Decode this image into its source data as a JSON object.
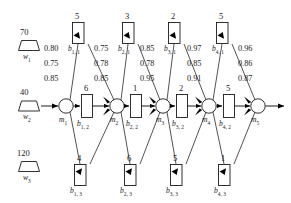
{
  "diagram": {
    "type": "block-flow-network",
    "colors": {
      "stroke": "#1a1a1a",
      "fill": "#ffffff",
      "text": "#1a1a1a",
      "arrow": "#000000"
    }
  },
  "inputs": [
    {
      "value": "70",
      "name": "w",
      "index": "1",
      "shape": "trapezoid"
    },
    {
      "value": "40",
      "name": "w",
      "index": "2",
      "shape": "trapezoid"
    },
    {
      "value": "120",
      "name": "w",
      "index": "3",
      "shape": "trapezoid"
    }
  ],
  "nodes": [
    {
      "name": "m",
      "index": "1"
    },
    {
      "name": "m",
      "index": "2"
    },
    {
      "name": "m",
      "index": "3"
    },
    {
      "name": "m",
      "index": "4"
    },
    {
      "name": "m",
      "index": "5"
    }
  ],
  "stages": [
    {
      "stage": 1,
      "top": {
        "value": "5",
        "name": "b",
        "index": "1, 1"
      },
      "middle": {
        "value": "6",
        "name": "b",
        "index": "1, 2"
      },
      "bottom": {
        "value": "4",
        "name": "b",
        "index": "1, 3"
      }
    },
    {
      "stage": 2,
      "top": {
        "value": "3",
        "name": "b",
        "index": "2, 1"
      },
      "middle": {
        "value": "1",
        "name": "b",
        "index": "2, 2"
      },
      "bottom": {
        "value": "6",
        "name": "b",
        "index": "2, 3"
      }
    },
    {
      "stage": 3,
      "top": {
        "value": "2",
        "name": "b",
        "index": "3, 1"
      },
      "middle": {
        "value": "2",
        "name": "b",
        "index": "3, 2"
      },
      "bottom": {
        "value": "5",
        "name": "b",
        "index": "3, 3"
      }
    },
    {
      "stage": 4,
      "top": {
        "value": "5",
        "name": "b",
        "index": "4, 1"
      },
      "middle": {
        "value": "5",
        "name": "b",
        "index": "4, 2"
      },
      "bottom": {
        "value": "1",
        "name": "b",
        "index": "4, 3"
      }
    }
  ],
  "weight_groups": [
    {
      "group": 1,
      "values": [
        "0.80",
        "0.75",
        "0.85"
      ]
    },
    {
      "group": 2,
      "values": [
        "0.75",
        "0.78",
        "0.85"
      ]
    },
    {
      "group": 3,
      "values": [
        "0.85",
        "0.78",
        "0.95"
      ]
    },
    {
      "group": 4,
      "values": [
        "0.97",
        "0.85",
        "0.91"
      ]
    },
    {
      "group": 5,
      "values": [
        "0.96",
        "0.86",
        "0.87"
      ]
    }
  ]
}
